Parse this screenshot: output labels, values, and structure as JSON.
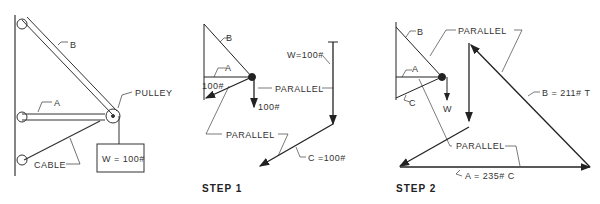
{
  "figure1": {
    "labels": {
      "member_b": "B",
      "member_a": "A",
      "pulley": "PULLEY",
      "cable": "CABLE",
      "weight": "W = 100#"
    }
  },
  "step1": {
    "title": "STEP 1",
    "labels": {
      "b": "B",
      "a": "A",
      "force_left": "100#",
      "force_down": "100#",
      "parallel_top": "PARALLEL",
      "parallel_bottom": "PARALLEL",
      "w": "W=100#",
      "c": "C =100#"
    }
  },
  "step2": {
    "title": "STEP 2",
    "labels": {
      "b": "B",
      "a": "A",
      "c": "C",
      "w": "W",
      "parallel_top": "PARALLEL",
      "parallel_bottom": "PARALLEL",
      "b_result": "B = 211# T",
      "a_result": "A = 235# C"
    }
  }
}
